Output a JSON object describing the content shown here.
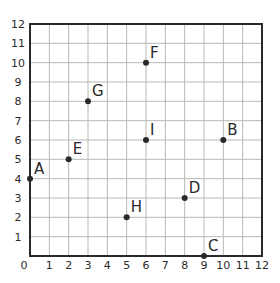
{
  "chart_data": {
    "type": "scatter",
    "title": "",
    "xlabel": "",
    "ylabel": "",
    "xlim": [
      0,
      12
    ],
    "ylim": [
      0,
      12
    ],
    "grid": true,
    "x_ticks": [
      "0",
      "1",
      "2",
      "3",
      "4",
      "5",
      "6",
      "7",
      "8",
      "9",
      "10",
      "11",
      "12"
    ],
    "y_ticks": [
      "1",
      "2",
      "3",
      "4",
      "5",
      "6",
      "7",
      "8",
      "9",
      "10",
      "11",
      "12"
    ],
    "points": [
      {
        "label": "A",
        "x": 0,
        "y": 4
      },
      {
        "label": "B",
        "x": 10,
        "y": 6
      },
      {
        "label": "C",
        "x": 9,
        "y": 0
      },
      {
        "label": "D",
        "x": 8,
        "y": 3
      },
      {
        "label": "E",
        "x": 2,
        "y": 5
      },
      {
        "label": "F",
        "x": 6,
        "y": 10
      },
      {
        "label": "G",
        "x": 3,
        "y": 8
      },
      {
        "label": "H",
        "x": 5,
        "y": 2
      },
      {
        "label": "I",
        "x": 6,
        "y": 6
      }
    ]
  },
  "colors": {
    "grid": "#b8b8b8",
    "axis": "#2a2a2a",
    "point": "#2a2a2a",
    "background": "#ffffff"
  }
}
